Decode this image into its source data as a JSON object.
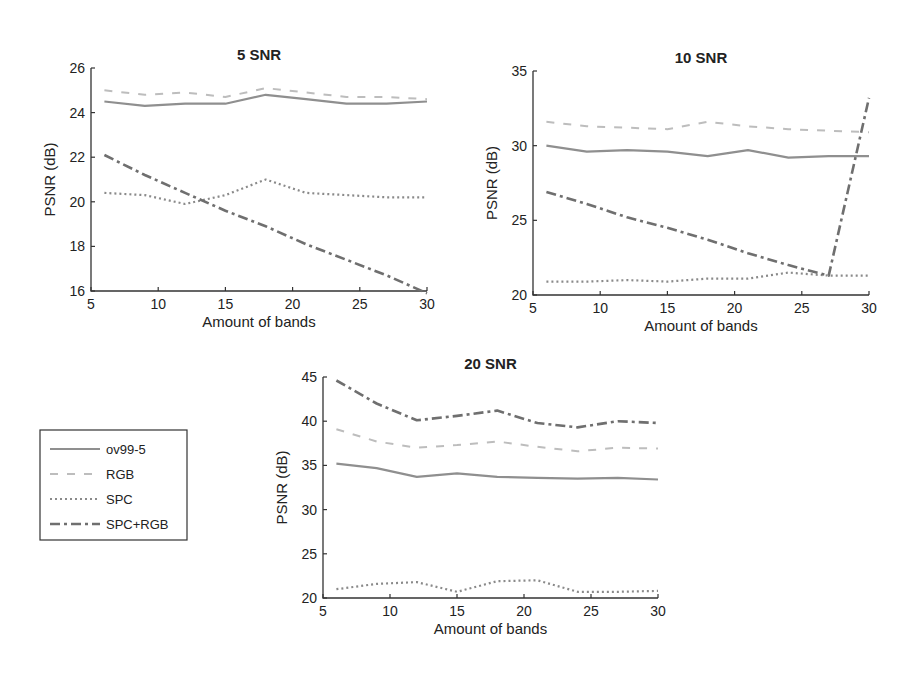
{
  "chart_data": [
    {
      "type": "line",
      "title": "5 SNR",
      "xlabel": "Amount of bands",
      "ylabel": "PSNR (dB)",
      "xlim": [
        5,
        30
      ],
      "ylim": [
        16,
        26
      ],
      "xticks": [
        5,
        10,
        15,
        20,
        25,
        30
      ],
      "yticks": [
        16,
        18,
        20,
        22,
        24,
        26
      ],
      "grid": false,
      "x": [
        6,
        9,
        12,
        15,
        18,
        21,
        24,
        27,
        30
      ],
      "series": [
        {
          "name": "ov99-5",
          "values": [
            24.5,
            24.3,
            24.4,
            24.4,
            24.8,
            24.6,
            24.4,
            24.4,
            24.5
          ]
        },
        {
          "name": "RGB",
          "values": [
            25.0,
            24.8,
            24.9,
            24.7,
            25.1,
            24.9,
            24.7,
            24.7,
            24.6
          ]
        },
        {
          "name": "SPC",
          "values": [
            20.4,
            20.3,
            19.9,
            20.3,
            21.0,
            20.4,
            20.3,
            20.2,
            20.2
          ]
        },
        {
          "name": "SPC+RGB",
          "values": [
            22.1,
            21.2,
            20.4,
            19.6,
            18.9,
            18.1,
            17.4,
            16.7,
            15.9
          ]
        }
      ]
    },
    {
      "type": "line",
      "title": "10 SNR",
      "xlabel": "Amount of bands",
      "ylabel": "PSNR (dB)",
      "xlim": [
        5,
        30
      ],
      "ylim": [
        20,
        35
      ],
      "xticks": [
        5,
        10,
        15,
        20,
        25,
        30
      ],
      "yticks": [
        20,
        25,
        30,
        35
      ],
      "grid": false,
      "x": [
        6,
        9,
        12,
        15,
        18,
        21,
        24,
        27,
        30
      ],
      "series": [
        {
          "name": "ov99-5",
          "values": [
            30.0,
            29.6,
            29.7,
            29.6,
            29.3,
            29.7,
            29.2,
            29.3,
            29.3
          ]
        },
        {
          "name": "RGB",
          "values": [
            31.6,
            31.3,
            31.2,
            31.1,
            31.6,
            31.3,
            31.1,
            31.0,
            30.9
          ]
        },
        {
          "name": "SPC",
          "values": [
            20.9,
            20.9,
            21.0,
            20.9,
            21.1,
            21.1,
            21.5,
            21.3,
            21.3
          ]
        },
        {
          "name": "SPC+RGB",
          "values": [
            26.9,
            26.1,
            25.2,
            24.5,
            23.7,
            22.8,
            22.0,
            21.3,
            33.2
          ]
        }
      ]
    },
    {
      "type": "line",
      "title": "20 SNR",
      "xlabel": "Amount of bands",
      "ylabel": "PSNR (dB)",
      "xlim": [
        5,
        30
      ],
      "ylim": [
        20,
        45
      ],
      "xticks": [
        5,
        10,
        15,
        20,
        25,
        30
      ],
      "yticks": [
        20,
        25,
        30,
        35,
        40,
        45
      ],
      "grid": false,
      "x": [
        6,
        9,
        12,
        15,
        18,
        21,
        24,
        27,
        30
      ],
      "series": [
        {
          "name": "ov99-5",
          "values": [
            35.2,
            34.7,
            33.7,
            34.1,
            33.7,
            33.6,
            33.5,
            33.6,
            33.4
          ]
        },
        {
          "name": "RGB",
          "values": [
            39.1,
            37.7,
            37.0,
            37.3,
            37.7,
            37.1,
            36.6,
            37.0,
            36.9
          ]
        },
        {
          "name": "SPC",
          "values": [
            21.0,
            21.6,
            21.8,
            20.7,
            21.9,
            22.0,
            20.7,
            20.7,
            20.8
          ]
        },
        {
          "name": "SPC+RGB",
          "values": [
            44.6,
            42.0,
            40.1,
            40.6,
            41.2,
            39.8,
            39.3,
            40.0,
            39.8
          ]
        }
      ]
    }
  ],
  "legend": {
    "position": "left of bottom chart",
    "entries": [
      {
        "name": "ov99-5",
        "style": "solid",
        "color": "#8a8a8a"
      },
      {
        "name": "RGB",
        "style": "dashed",
        "color": "#b8b8b8"
      },
      {
        "name": "SPC",
        "style": "dotted",
        "color": "#8a8a8a"
      },
      {
        "name": "SPC+RGB",
        "style": "dashdot",
        "color": "#6e6e6e"
      }
    ]
  },
  "styles": {
    "ov99-5": {
      "color": "#8f8f8f",
      "dash": "",
      "width": 2.2
    },
    "RGB": {
      "color": "#bdbdbd",
      "dash": "8,9",
      "width": 2
    },
    "SPC": {
      "color": "#8a8a8a",
      "dash": "2,3",
      "width": 2.2
    },
    "SPC+RGB": {
      "color": "#6f6f6f",
      "dash": "10,4,3,4",
      "width": 2.6
    }
  },
  "layout": [
    {
      "left": 91,
      "right": 427,
      "top": 68,
      "bottom": 291
    },
    {
      "left": 533,
      "right": 869,
      "top": 71,
      "bottom": 295
    },
    {
      "left": 323,
      "right": 658,
      "top": 377,
      "bottom": 598
    }
  ]
}
